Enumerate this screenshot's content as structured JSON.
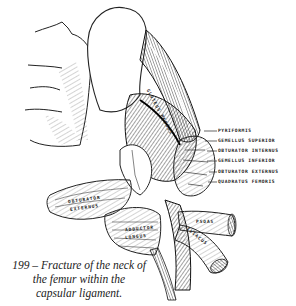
{
  "figure": {
    "number": "199",
    "caption_line1": "199 – Fracture of the neck of",
    "caption_line2": "the femur within the",
    "caption_line3": "capsular ligament.",
    "labels": [
      {
        "text": "PYRIFORMIS"
      },
      {
        "text": "GEMELLUS SUPERIOR"
      },
      {
        "text": "OBTURATOR INTERNUS"
      },
      {
        "text": "GEMELLUS INFERIOR"
      },
      {
        "text": "OBTURATOR EXTERNUS"
      },
      {
        "text": "QUADRATUS FEMORIS"
      }
    ],
    "inline_labels": {
      "gluteus": "GLUTEUS MEDIUS",
      "obt_ext": "OBTURATOR",
      "obt_ext2": "EXTERNUS",
      "adductor": "ADDUCTOR",
      "adductor2": "LONGUS",
      "psoas": "PSOAS",
      "iliacus": "ILIACUS"
    }
  },
  "colors": {
    "ink": "#1a1a1a",
    "background": "#ffffff"
  }
}
